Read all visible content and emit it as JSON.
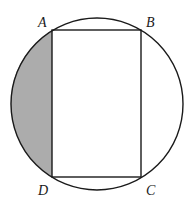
{
  "diagram": {
    "type": "rectangle inscribed in circle with shaded segment",
    "circle": {
      "cx": 97,
      "cy": 104,
      "r": 86
    },
    "rectangle": {
      "vertices": [
        {
          "label": "A",
          "x": 52,
          "y": 30
        },
        {
          "label": "B",
          "x": 141,
          "y": 30
        },
        {
          "label": "C",
          "x": 141,
          "y": 177
        },
        {
          "label": "D",
          "x": 52,
          "y": 177
        }
      ]
    },
    "shaded_region": {
      "description": "circular segment cut off by chord AD",
      "color": "#acacac"
    },
    "stroke_color": "#1a1a1a",
    "labels": {
      "A": "A",
      "B": "B",
      "C": "C",
      "D": "D"
    }
  }
}
